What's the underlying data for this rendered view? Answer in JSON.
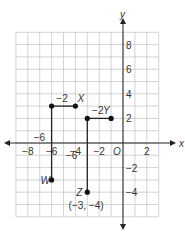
{
  "diagram": {
    "type": "coordinate-plane",
    "axes": {
      "x_label": "x",
      "y_label": "y",
      "origin_label": "O",
      "x_range": [
        -9,
        3
      ],
      "y_range": [
        -6,
        9
      ],
      "x_ticks": [
        {
          "value": -8,
          "label": "−8"
        },
        {
          "value": -6,
          "label": "−6"
        },
        {
          "value": -4,
          "label": "−4"
        },
        {
          "value": -2,
          "label": "−2"
        },
        {
          "value": 2,
          "label": "2"
        }
      ],
      "y_ticks": [
        {
          "value": 8,
          "label": "8"
        },
        {
          "value": 6,
          "label": "6"
        },
        {
          "value": 4,
          "label": "4"
        },
        {
          "value": 2,
          "label": "2"
        },
        {
          "value": -2,
          "label": "−2"
        },
        {
          "value": -4,
          "label": "−4"
        }
      ]
    },
    "points": [
      {
        "name": "X",
        "x": -4,
        "y": 3,
        "label": "X"
      },
      {
        "name": "corner1",
        "x": -6,
        "y": 3,
        "label": ""
      },
      {
        "name": "W",
        "x": -6,
        "y": -3,
        "label": "W"
      },
      {
        "name": "Y",
        "x": -1,
        "y": 2,
        "label": "Y"
      },
      {
        "name": "corner2",
        "x": -3,
        "y": 2,
        "label": ""
      },
      {
        "name": "Z",
        "x": -3,
        "y": -4,
        "label": "Z"
      }
    ],
    "segment_labels": {
      "xw_horizontal": "−2",
      "xw_vertical": "−6",
      "yz_horizontal": "−2",
      "yz_vertical": "−6"
    },
    "z_coordinate_label": "(−3, −4)"
  }
}
